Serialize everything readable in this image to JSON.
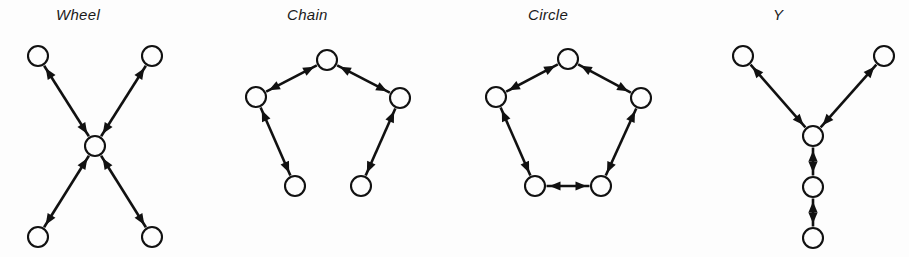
{
  "figure": {
    "background_color": "#fdfdfd",
    "ink_color": "#111111",
    "node_radius": 10,
    "node_count_per_panel": 5,
    "edge_style": "double-headed arrow"
  },
  "panels": [
    {
      "id": "wheel",
      "title": "Wheel",
      "title_x": 96,
      "description": "star / wheel network: four peripheral nodes all connected to one central node",
      "nodes": [
        {
          "name": "node-top-left",
          "x": 38,
          "y": 56
        },
        {
          "name": "node-top-right",
          "x": 152,
          "y": 56
        },
        {
          "name": "node-center",
          "x": 95,
          "y": 146
        },
        {
          "name": "node-bottom-left",
          "x": 38,
          "y": 237
        },
        {
          "name": "node-bottom-right",
          "x": 152,
          "y": 237
        }
      ],
      "edges": [
        {
          "from": 0,
          "to": 2
        },
        {
          "from": 1,
          "to": 2
        },
        {
          "from": 3,
          "to": 2
        },
        {
          "from": 4,
          "to": 2
        }
      ]
    },
    {
      "id": "chain",
      "title": "Chain",
      "title_x": 327,
      "description": "chain network: five nodes linked end to end, open pentagon",
      "nodes": [
        {
          "name": "node-apex",
          "x": 327,
          "y": 60
        },
        {
          "name": "node-left-upper",
          "x": 256,
          "y": 97
        },
        {
          "name": "node-right-upper",
          "x": 400,
          "y": 98
        },
        {
          "name": "node-left-lower",
          "x": 295,
          "y": 186
        },
        {
          "name": "node-right-lower",
          "x": 361,
          "y": 186
        }
      ],
      "edges": [
        {
          "from": 1,
          "to": 0
        },
        {
          "from": 0,
          "to": 2
        },
        {
          "from": 1,
          "to": 3
        },
        {
          "from": 2,
          "to": 4
        }
      ]
    },
    {
      "id": "circle",
      "title": "Circle",
      "title_x": 568,
      "description": "circle network: five nodes forming a closed pentagon ring",
      "nodes": [
        {
          "name": "node-apex",
          "x": 568,
          "y": 59
        },
        {
          "name": "node-left-upper",
          "x": 496,
          "y": 97
        },
        {
          "name": "node-right-upper",
          "x": 641,
          "y": 98
        },
        {
          "name": "node-left-lower",
          "x": 535,
          "y": 186
        },
        {
          "name": "node-right-lower",
          "x": 601,
          "y": 186
        }
      ],
      "edges": [
        {
          "from": 1,
          "to": 0
        },
        {
          "from": 0,
          "to": 2
        },
        {
          "from": 1,
          "to": 3
        },
        {
          "from": 2,
          "to": 4
        },
        {
          "from": 3,
          "to": 4
        }
      ]
    },
    {
      "id": "y",
      "title": "Y",
      "title_x": 813,
      "description": "Y network: two nodes joining a junction node that heads a two-node tail",
      "nodes": [
        {
          "name": "node-top-left",
          "x": 743,
          "y": 56
        },
        {
          "name": "node-top-right",
          "x": 884,
          "y": 56
        },
        {
          "name": "node-junction",
          "x": 813,
          "y": 136
        },
        {
          "name": "node-middle",
          "x": 813,
          "y": 187
        },
        {
          "name": "node-bottom",
          "x": 813,
          "y": 238
        }
      ],
      "edges": [
        {
          "from": 0,
          "to": 2
        },
        {
          "from": 1,
          "to": 2
        },
        {
          "from": 2,
          "to": 3
        },
        {
          "from": 3,
          "to": 4
        }
      ]
    }
  ]
}
